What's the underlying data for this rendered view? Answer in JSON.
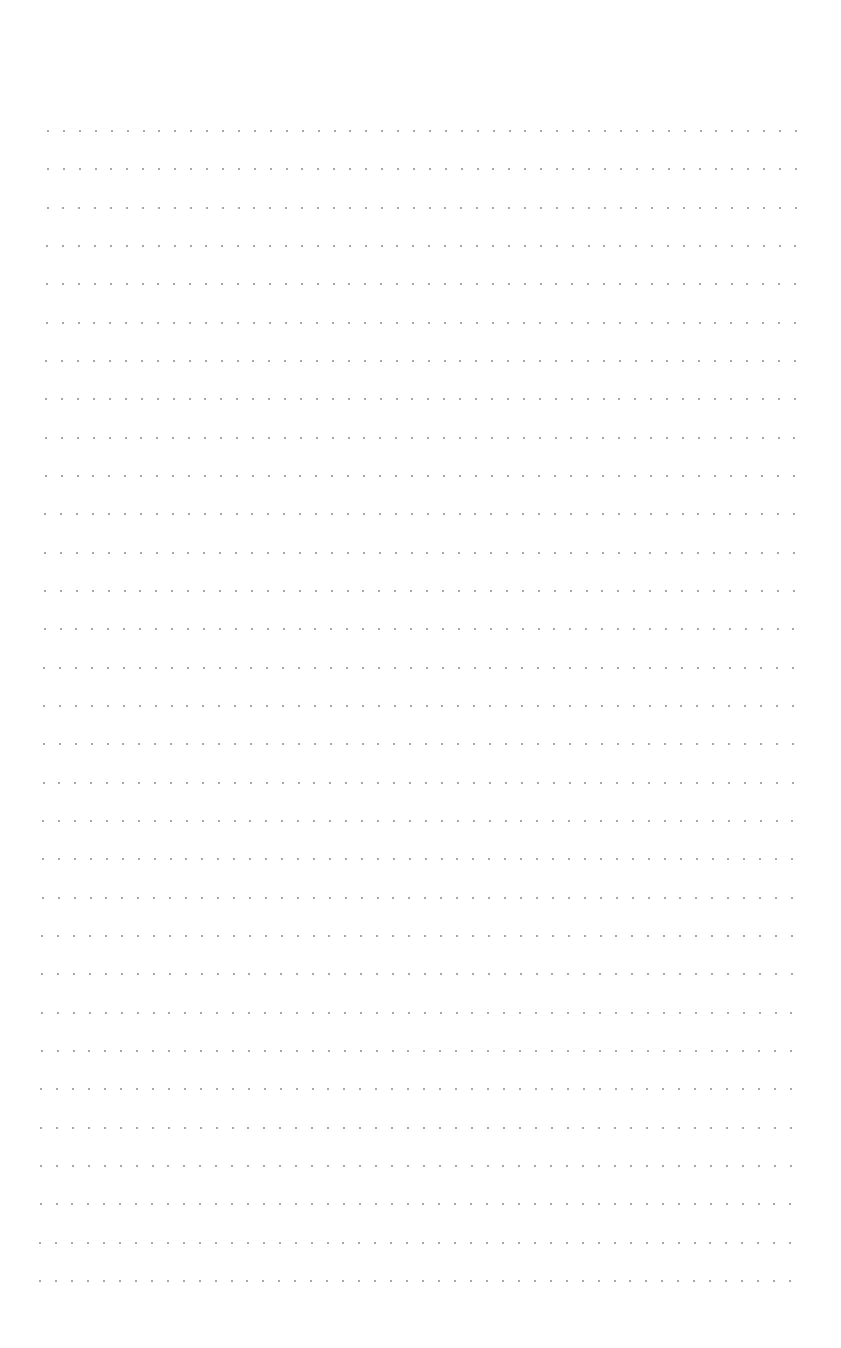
{
  "page": {
    "type": "dot-grid paper",
    "background": "#ffffff",
    "dot_color": "#8a8a8a",
    "rows": 31,
    "cols": 48,
    "first_row_y": 131,
    "last_row_y": 1281,
    "first_row_x_start": 48,
    "first_row_x_end": 796,
    "last_row_x_start": 40,
    "last_row_x_end": 790
  }
}
